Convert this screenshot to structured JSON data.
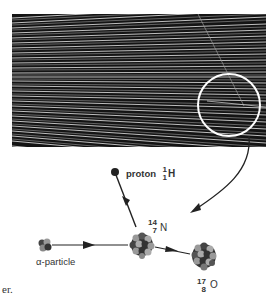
{
  "figure": {
    "photo": {
      "description": "cloud chamber photograph of alpha-particle tracks",
      "highlight": "circled region showing branching track"
    },
    "labels": {
      "proton": "proton",
      "proton_symbol": "H",
      "proton_mass": "1",
      "proton_atomic": "1",
      "nitrogen_symbol": "N",
      "nitrogen_mass": "14",
      "nitrogen_atomic": "7",
      "oxygen_symbol": "O",
      "oxygen_mass": "17",
      "oxygen_atomic": "8",
      "alpha": "α-particle"
    },
    "caption_fragment": "er."
  }
}
